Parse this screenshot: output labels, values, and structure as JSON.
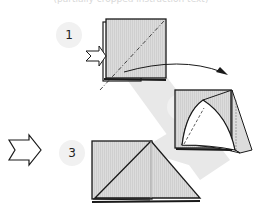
{
  "caption": "(partially cropped instruction text)",
  "steps": [
    {
      "number": "1",
      "x": 69,
      "y": 35
    },
    {
      "number": "2",
      "x": 179,
      "y": 107
    },
    {
      "number": "3",
      "x": 72,
      "y": 153
    }
  ],
  "colors": {
    "paper": "#dcdcdc",
    "paper_hatch": "#c8c8c8",
    "outline": "#1a1a1a",
    "shadow_band": "#e6e6e6",
    "step_circle": "#f1f1f1"
  },
  "icons": [
    "push-arrow-icon",
    "curved-arrow-icon",
    "push-arrow-outline-icon"
  ]
}
